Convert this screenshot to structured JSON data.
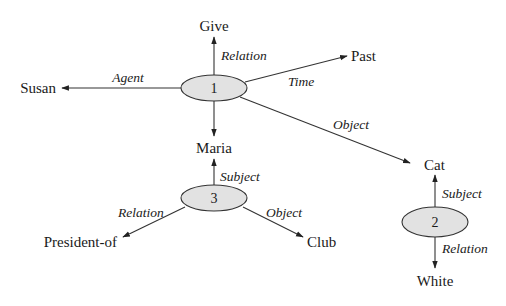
{
  "diagram": {
    "type": "semantic-network",
    "frames": [
      {
        "id": "1",
        "cx": 214,
        "cy": 88,
        "rx": 33,
        "ry": 13
      },
      {
        "id": "2",
        "cx": 435,
        "cy": 222,
        "rx": 33,
        "ry": 15
      },
      {
        "id": "3",
        "cx": 214,
        "cy": 198,
        "rx": 33,
        "ry": 13
      }
    ],
    "concepts": {
      "give": "Give",
      "past": "Past",
      "susan": "Susan",
      "maria": "Maria",
      "cat": "Cat",
      "white": "White",
      "president_of": "President-of",
      "club": "Club"
    },
    "edges": {
      "f1_relation": "Relation",
      "f1_time": "Time",
      "f1_agent": "Agent",
      "f1_object": "Object",
      "f3_subject": "Subject",
      "f3_relation": "Relation",
      "f3_object": "Object",
      "f2_subject": "Subject",
      "f2_relation": "Relation"
    },
    "relations": [
      {
        "from": "1",
        "label": "Relation",
        "to": "Give"
      },
      {
        "from": "1",
        "label": "Time",
        "to": "Past"
      },
      {
        "from": "1",
        "label": "Agent",
        "to": "Susan"
      },
      {
        "from": "1",
        "label": "Object",
        "to": "Cat"
      },
      {
        "from": "1",
        "label": "",
        "to": "Maria"
      },
      {
        "from": "3",
        "label": "Subject",
        "to": "Maria"
      },
      {
        "from": "3",
        "label": "Relation",
        "to": "President-of"
      },
      {
        "from": "3",
        "label": "Object",
        "to": "Club"
      },
      {
        "from": "2",
        "label": "Subject",
        "to": "Cat"
      },
      {
        "from": "2",
        "label": "Relation",
        "to": "White"
      }
    ],
    "colors": {
      "ellipse_fill": "#e2e2e2",
      "stroke": "#333333",
      "text": "#1a1a1a"
    }
  }
}
